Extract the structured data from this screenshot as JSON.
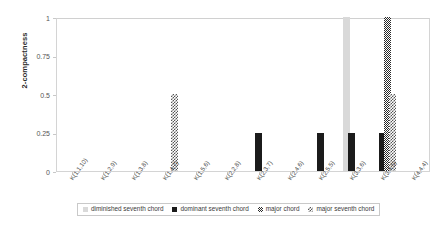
{
  "chart_data": {
    "type": "bar",
    "title": "",
    "xlabel": "",
    "ylabel": "2-compactness",
    "ylim": [
      0,
      1
    ],
    "yticks": [
      "0",
      "0.25",
      "0.5",
      "0.75",
      "1"
    ],
    "ytick_values": [
      0,
      0.25,
      0.5,
      0.75,
      1
    ],
    "grid": false,
    "legend_position": "bottom",
    "categories": [
      "K(1,1,10)",
      "K(1,2,9)",
      "K(1,3,8)",
      "K(1,4,7)",
      "K(1,5,6)",
      "K(2,2,8)",
      "K(2,3,7)",
      "K(2,4,6)",
      "K(2,5,5)",
      "K(3,3,6)",
      "K(3,4,5)",
      "K(4,4,4)"
    ],
    "series": [
      {
        "name": "diminished seventh chord",
        "style": "light-gray",
        "color": "#d9d9d9",
        "values": [
          0,
          0,
          0,
          0,
          0,
          0,
          0,
          0,
          0,
          1,
          0,
          0
        ]
      },
      {
        "name": "dominant seventh chord",
        "style": "black",
        "color": "#1b1b1b",
        "values": [
          0,
          0,
          0,
          0,
          0,
          0,
          0.25,
          0,
          0.25,
          0.25,
          0.25,
          0
        ]
      },
      {
        "name": "major chord",
        "style": "dense-checker",
        "color": "#2a2a2a",
        "values": [
          0,
          0,
          0,
          0,
          0,
          0,
          0,
          0,
          0,
          0,
          1,
          0
        ]
      },
      {
        "name": "major seventh chord",
        "style": "coarse-checker",
        "color": "#555555",
        "values": [
          0,
          0,
          0,
          0.5,
          0,
          0,
          0,
          0,
          0,
          0,
          0.5,
          0
        ]
      }
    ]
  },
  "legend": {
    "items": [
      {
        "label": "diminished seventh chord"
      },
      {
        "label": "dominant seventh chord"
      },
      {
        "label": "major chord"
      },
      {
        "label": "major seventh chord"
      }
    ]
  }
}
